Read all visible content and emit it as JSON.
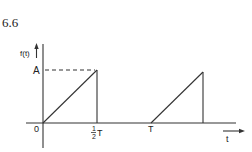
{
  "figure": {
    "number": "6.6",
    "y_axis_label": "f(t)",
    "x_axis_label": "t",
    "origin_label": "0",
    "amplitude_label": "A",
    "half_period_label_num": "1",
    "half_period_label_den": "2",
    "half_period_label_T": "T",
    "period_label": "T"
  },
  "colors": {
    "line": "#333333",
    "background": "#ffffff"
  }
}
